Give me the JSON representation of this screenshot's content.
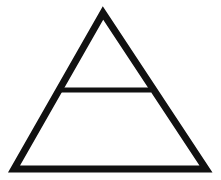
{
  "diagram": {
    "symbol": "triangle-with-horizontal-bar",
    "stroke_color": "#111111",
    "background_color": "#ffffff",
    "triangle": {
      "apex": [
        103,
        13
      ],
      "bottom_left": [
        14,
        169
      ],
      "bottom_right": [
        206,
        169
      ],
      "stroke_width": 7
    },
    "bar": {
      "start": [
        58,
        90
      ],
      "end": [
        151,
        90
      ],
      "stroke_width": 5
    }
  }
}
